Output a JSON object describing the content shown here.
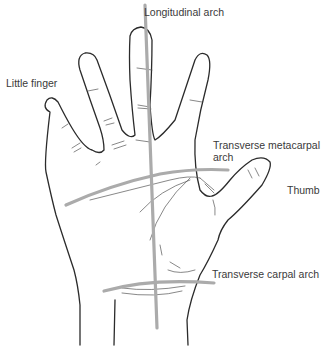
{
  "figure": {
    "colors": {
      "outline": "#2b2b2b",
      "arch_line": "#ababab",
      "label_text": "#3a3a3a",
      "background": "#ffffff"
    }
  },
  "labels": {
    "longitudinal_arch": "Longitudinal arch",
    "little_finger": "Little finger",
    "transverse_metacarpal_arch_line1": "Transverse metacarpal",
    "transverse_metacarpal_arch_line2": "arch",
    "thumb": "Thumb",
    "transverse_carpal_arch": "Transverse carpal  arch"
  }
}
